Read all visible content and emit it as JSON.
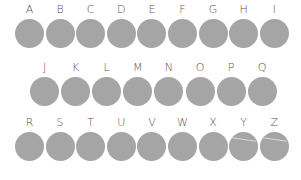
{
  "colors": {
    "circle": "#a5a5a5",
    "label": "#555555",
    "background": "#ffffff"
  },
  "rows": [
    {
      "labels": [
        "A",
        "B",
        "C",
        "D",
        "E",
        "F",
        "G",
        "H",
        "I"
      ]
    },
    {
      "labels": [
        "J",
        "K",
        "L",
        "M",
        "N",
        "O",
        "P",
        "Q"
      ]
    },
    {
      "labels": [
        "R",
        "S",
        "T",
        "U",
        "V",
        "W",
        "X",
        "Y",
        "Z"
      ]
    }
  ]
}
